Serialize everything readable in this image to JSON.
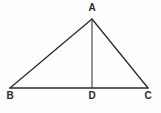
{
  "figure": {
    "type": "geometry-diagram",
    "shape": "triangle-with-altitude",
    "background_color": "#fefefe",
    "stroke_color": "#2b2b2b",
    "label_color": "#2b2b2b",
    "canvas": {
      "width": 161,
      "height": 113
    },
    "labels": {
      "apex": "A",
      "left_base": "B",
      "right_base": "C",
      "foot_of_altitude": "D"
    },
    "points": {
      "A": {
        "x": 92,
        "y": 19
      },
      "B": {
        "x": 10,
        "y": 88
      },
      "C": {
        "x": 148,
        "y": 88
      },
      "D": {
        "x": 92,
        "y": 88
      }
    },
    "segments": [
      {
        "name": "AB",
        "from": "A",
        "to": "B",
        "style": "solid",
        "width": 1.3
      },
      {
        "name": "AC",
        "from": "A",
        "to": "C",
        "style": "solid",
        "width": 1.3
      },
      {
        "name": "BC",
        "from": "B",
        "to": "C",
        "style": "solid",
        "width": 1.3
      },
      {
        "name": "AD",
        "from": "A",
        "to": "D",
        "style": "solid",
        "width": 1.1
      }
    ]
  }
}
